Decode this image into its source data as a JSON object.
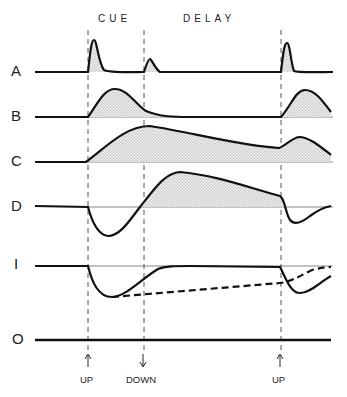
{
  "header": {
    "cue_label": "CUE",
    "delay_label": "DELAY"
  },
  "rows": [
    {
      "label": "A"
    },
    {
      "label": "B"
    },
    {
      "label": "C"
    },
    {
      "label": "D"
    },
    {
      "label": "I"
    },
    {
      "label": "O"
    }
  ],
  "events": [
    {
      "label": "UP",
      "arrow": "up"
    },
    {
      "label": "DOWN",
      "arrow": "down"
    },
    {
      "label": "UP",
      "arrow": "up"
    }
  ],
  "colors": {
    "ink": "#111111",
    "fill": "#d8d8d8",
    "background": "#ffffff"
  }
}
